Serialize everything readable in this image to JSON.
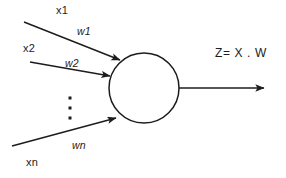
{
  "diagram": {
    "type": "neuron-schematic",
    "background_color": "#ffffff",
    "stroke_color": "#1c1c1c",
    "text_color": "#1c1c1c",
    "inputs": [
      {
        "id": "input-1",
        "signal_label": "x1",
        "weight_label": "w1"
      },
      {
        "id": "input-2",
        "signal_label": "x2",
        "weight_label": "w2"
      },
      {
        "id": "input-n",
        "signal_label": "xn",
        "weight_label": "wn"
      }
    ],
    "ellipsis": "⋮",
    "ellipsis_dots": 3,
    "node": {
      "shape": "circle",
      "center_x": 144,
      "center_y": 88,
      "radius": 35,
      "fill": "none"
    },
    "output": {
      "label": "Z= X . W"
    },
    "edges": [
      {
        "name": "edge-x1",
        "from_x": 24,
        "from_y": 22,
        "to_x": 122,
        "to_y": 61,
        "arrow": true
      },
      {
        "name": "edge-x2",
        "from_x": 30,
        "from_y": 62,
        "to_x": 112,
        "to_y": 76,
        "arrow": true
      },
      {
        "name": "edge-xn",
        "from_x": 12,
        "from_y": 146,
        "to_x": 118,
        "to_y": 117,
        "arrow": true
      },
      {
        "name": "edge-out",
        "from_x": 179,
        "from_y": 88,
        "to_x": 266,
        "to_y": 88,
        "arrow": true
      }
    ]
  }
}
